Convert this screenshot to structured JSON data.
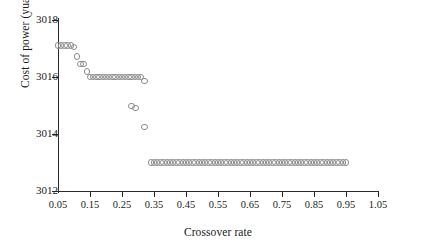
{
  "chart_data": {
    "type": "scatter",
    "title": "",
    "xlabel": "Crossover rate",
    "ylabel": "Cost of power (yuan)",
    "xlim": [
      0.05,
      1.05
    ],
    "ylim": [
      3012,
      3018
    ],
    "xticks": [
      "0.05",
      "0.15",
      "0.25",
      "0.35",
      "0.45",
      "0.55",
      "0.65",
      "0.75",
      "0.85",
      "0.95",
      "1.05"
    ],
    "xtick_values": [
      0.05,
      0.15,
      0.25,
      0.35,
      0.45,
      0.55,
      0.65,
      0.75,
      0.85,
      0.95,
      1.05
    ],
    "yticks": [
      "3012",
      "3014",
      "3016",
      "3018"
    ],
    "ytick_values": [
      3012,
      3014,
      3016,
      3018
    ],
    "grid": false,
    "legend": null,
    "marker": "open-circle",
    "marker_color": "#8c8c8c",
    "series": [
      {
        "name": "Cost of power vs crossover rate",
        "x": [
          0.05,
          0.06,
          0.07,
          0.08,
          0.09,
          0.1,
          0.11,
          0.12,
          0.13,
          0.14,
          0.15,
          0.16,
          0.17,
          0.18,
          0.19,
          0.2,
          0.21,
          0.22,
          0.23,
          0.24,
          0.25,
          0.26,
          0.27,
          0.28,
          0.29,
          0.3,
          0.31,
          0.32,
          0.28,
          0.292,
          0.32,
          0.34,
          0.35,
          0.36,
          0.37,
          0.38,
          0.39,
          0.4,
          0.41,
          0.42,
          0.43,
          0.44,
          0.45,
          0.46,
          0.47,
          0.48,
          0.49,
          0.5,
          0.51,
          0.52,
          0.53,
          0.54,
          0.55,
          0.56,
          0.57,
          0.58,
          0.59,
          0.6,
          0.61,
          0.62,
          0.63,
          0.64,
          0.65,
          0.66,
          0.67,
          0.68,
          0.69,
          0.7,
          0.71,
          0.72,
          0.73,
          0.74,
          0.75,
          0.76,
          0.77,
          0.78,
          0.79,
          0.8,
          0.81,
          0.82,
          0.83,
          0.84,
          0.85,
          0.86,
          0.87,
          0.88,
          0.89,
          0.9,
          0.91,
          0.92,
          0.93,
          0.94,
          0.95
        ],
        "y": [
          3017.1,
          3017.1,
          3017.1,
          3017.1,
          3017.1,
          3017.05,
          3016.72,
          3016.45,
          3016.45,
          3016.2,
          3016.0,
          3016.0,
          3016.0,
          3016.0,
          3016.0,
          3016.0,
          3016.0,
          3016.0,
          3016.0,
          3016.0,
          3016.0,
          3016.0,
          3016.0,
          3016.0,
          3016.0,
          3016.0,
          3016.0,
          3015.85,
          3014.98,
          3014.92,
          3014.25,
          3013.0,
          3013.0,
          3013.0,
          3013.0,
          3013.0,
          3013.0,
          3013.0,
          3013.0,
          3013.0,
          3013.0,
          3013.0,
          3013.0,
          3013.0,
          3013.0,
          3013.0,
          3013.0,
          3013.0,
          3013.0,
          3013.0,
          3013.0,
          3013.0,
          3013.0,
          3013.0,
          3013.0,
          3013.0,
          3013.0,
          3013.0,
          3013.0,
          3013.0,
          3013.0,
          3013.0,
          3013.0,
          3013.0,
          3013.0,
          3013.0,
          3013.0,
          3013.0,
          3013.0,
          3013.0,
          3013.0,
          3013.0,
          3013.0,
          3013.0,
          3013.0,
          3013.0,
          3013.0,
          3013.0,
          3013.0,
          3013.0,
          3013.0,
          3013.0,
          3013.0,
          3013.0,
          3013.0,
          3013.0,
          3013.0,
          3013.0,
          3013.0,
          3013.0,
          3013.0,
          3013.0,
          3013.0
        ]
      }
    ]
  }
}
